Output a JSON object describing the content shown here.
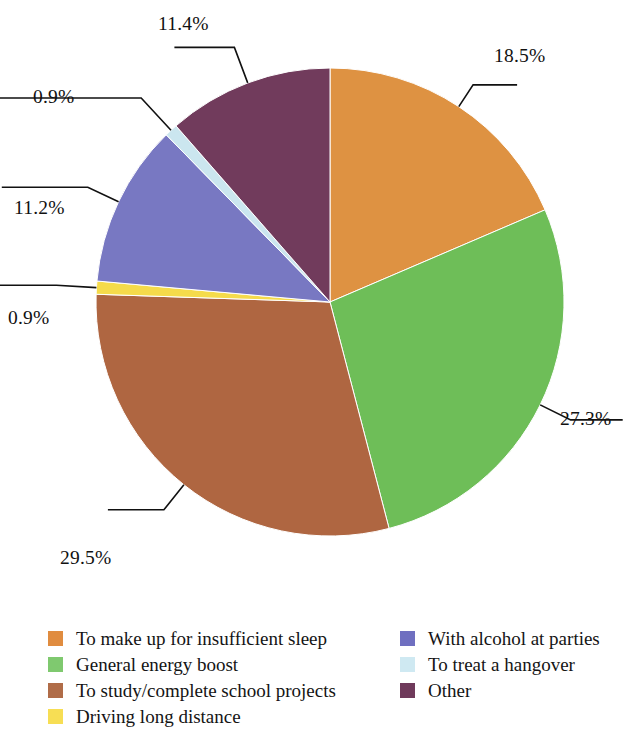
{
  "chart_data": {
    "type": "pie",
    "title": "",
    "subtitle": "",
    "xlabel": "",
    "ylabel": "",
    "grid": false,
    "legend_position": "bottom",
    "units": "percent",
    "start_angle_deg": 0,
    "direction": "clockwise",
    "center": {
      "x": 330,
      "y": 302
    },
    "radius": 234,
    "categories": [
      "To make up for insufficient sleep",
      "General energy boost",
      "To study/complete school projects",
      "Driving long distance",
      "With alcohol at parties",
      "To treat a hangover",
      "Other"
    ],
    "values": [
      18.5,
      27.3,
      29.5,
      0.9,
      11.2,
      0.9,
      11.4
    ],
    "labels": [
      "18.5%",
      "27.3%",
      "29.5%",
      "0.9%",
      "11.2%",
      "0.9%",
      "11.4%"
    ],
    "colors": [
      "#DE9242",
      "#6EBE58",
      "#AF6641",
      "#F5DB4B",
      "#7878C2",
      "#CBE6EF",
      "#713B5C"
    ],
    "slices": [
      {
        "name": "To make up for insufficient sleep",
        "value": 18.5,
        "label": "18.5%",
        "color": "#DE9242"
      },
      {
        "name": "General energy boost",
        "value": 27.3,
        "label": "27.3%",
        "color": "#6EBE58"
      },
      {
        "name": "To study/complete school projects",
        "value": 29.5,
        "label": "29.5%",
        "color": "#AF6641"
      },
      {
        "name": "Driving long distance",
        "value": 0.9,
        "label": "0.9%",
        "color": "#F5DB4B"
      },
      {
        "name": "With alcohol at parties",
        "value": 11.2,
        "label": "11.2%",
        "color": "#7878C2"
      },
      {
        "name": "To treat a hangover",
        "value": 0.9,
        "label": "0.9%",
        "color": "#CBE6EF"
      },
      {
        "name": "Other",
        "value": 11.4,
        "label": "11.4%",
        "color": "#713B5C"
      }
    ]
  },
  "callouts": [
    {
      "id": "callout-18-5",
      "text": "18.5%",
      "left": 494,
      "top": 46
    },
    {
      "id": "callout-27-3",
      "text": "27.3%",
      "left": 560,
      "top": 409
    },
    {
      "id": "callout-29-5",
      "text": "29.5%",
      "left": 60,
      "top": 548
    },
    {
      "id": "callout-0-9-driving",
      "text": "0.9%",
      "left": 8,
      "top": 308
    },
    {
      "id": "callout-11-2",
      "text": "11.2%",
      "left": 14,
      "top": 198
    },
    {
      "id": "callout-0-9-hangover",
      "text": "0.9%",
      "left": 33,
      "top": 87
    },
    {
      "id": "callout-11-4",
      "text": "11.4%",
      "left": 158,
      "top": 14
    }
  ],
  "legend": {
    "left_column": [
      {
        "label": "To make up for insufficient sleep",
        "color": "#E08C3F"
      },
      {
        "label": "General energy boost",
        "color": "#7FC96F"
      },
      {
        "label": "To study/complete school projects",
        "color": "#B06C48"
      },
      {
        "label": "Driving long distance",
        "color": "#F7DE54"
      }
    ],
    "right_column": [
      {
        "label": "With alcohol at parties",
        "color": "#6F6FC0"
      },
      {
        "label": "To treat a hangover",
        "color": "#CFE9F2"
      },
      {
        "label": "Other",
        "color": "#6F3A5B"
      }
    ]
  }
}
